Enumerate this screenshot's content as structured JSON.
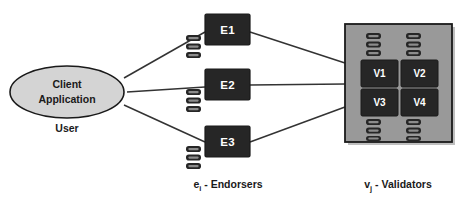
{
  "diagram": {
    "colors": {
      "node_dark": "#262626",
      "node_text": "#ffffff",
      "client_fill": "#d4d4d4",
      "client_stroke": "#1a1a1a",
      "validator_group_fill": "#999999",
      "validator_group_stroke": "#1a1a1a",
      "edge": "#333333",
      "ledger_dark": "#262626",
      "ledger_inner": "#8c8c8c",
      "background": "#ffffff",
      "text": "#1a1a1a",
      "shadow": "#bfbfbf"
    },
    "client": {
      "label_line1": "Client",
      "label_line2": "Application",
      "caption": "User"
    },
    "endorsers": {
      "caption_symbol": "e",
      "caption_subscript": "i",
      "caption_text": " - Endorsers",
      "nodes": [
        {
          "id": "E1",
          "label": "E1",
          "ledger_blocks": 3
        },
        {
          "id": "E2",
          "label": "E2",
          "ledger_blocks": 3
        },
        {
          "id": "E3",
          "label": "E3",
          "ledger_blocks": 3
        }
      ]
    },
    "validators": {
      "caption_symbol": "v",
      "caption_subscript": "j",
      "caption_text": " - Validators",
      "nodes": [
        {
          "id": "V1",
          "label": "V1"
        },
        {
          "id": "V2",
          "label": "V2"
        },
        {
          "id": "V3",
          "label": "V3"
        },
        {
          "id": "V4",
          "label": "V4"
        }
      ],
      "ledger_stacks": 4,
      "ledger_blocks_per_stack": 3
    },
    "edges": [
      {
        "from": "Client Application",
        "to": "E1"
      },
      {
        "from": "Client Application",
        "to": "E2"
      },
      {
        "from": "Client Application",
        "to": "E3"
      },
      {
        "from": "E1",
        "to": "Validators"
      },
      {
        "from": "E2",
        "to": "Validators"
      },
      {
        "from": "E3",
        "to": "Validators"
      }
    ]
  }
}
